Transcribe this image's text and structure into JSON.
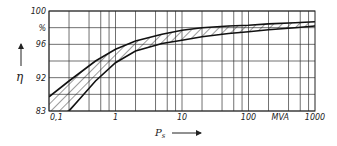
{
  "chart_data": {
    "type": "area",
    "title": "",
    "xlabel": "P_s",
    "xunit": "MVA",
    "ylabel": "η",
    "yunit": "%",
    "xscale": "log",
    "xlim": [
      0.1,
      1000
    ],
    "ylim": [
      88,
      100
    ],
    "ytick_labels": [
      {
        "value": 100,
        "label": "100"
      },
      {
        "value": 98,
        "label": "%"
      },
      {
        "value": 96,
        "label": "96"
      },
      {
        "value": 92,
        "label": "92"
      },
      {
        "value": 88,
        "label": "83"
      }
    ],
    "xtick_labels": [
      {
        "value": 0.1,
        "label": "0,1"
      },
      {
        "value": 1,
        "label": "1"
      },
      {
        "value": 10,
        "label": "10"
      },
      {
        "value": 100,
        "label": "100"
      },
      {
        "value": 300,
        "label": "MVA"
      },
      {
        "value": 1000,
        "label": "1000"
      }
    ],
    "grid": true,
    "series": [
      {
        "name": "upper bound",
        "x": [
          0.1,
          0.2,
          0.5,
          1,
          2,
          5,
          10,
          20,
          50,
          100,
          200,
          500,
          1000
        ],
        "values": [
          89.7,
          91.6,
          94.0,
          95.4,
          96.4,
          97.2,
          97.7,
          98.0,
          98.2,
          98.3,
          98.45,
          98.6,
          98.7
        ]
      },
      {
        "name": "lower bound",
        "x": [
          0.1,
          0.2,
          0.5,
          1,
          2,
          5,
          10,
          20,
          50,
          100,
          200,
          500,
          1000
        ],
        "values": [
          87.0,
          88.0,
          91.6,
          93.8,
          95.2,
          96.1,
          96.5,
          96.9,
          97.3,
          97.5,
          97.75,
          98.0,
          98.2
        ]
      }
    ],
    "fill": "hatched band between upper and lower bound"
  },
  "labels": {
    "y_axis_symbol": "η",
    "x_axis_symbol": "P",
    "x_axis_subscript": "s"
  }
}
